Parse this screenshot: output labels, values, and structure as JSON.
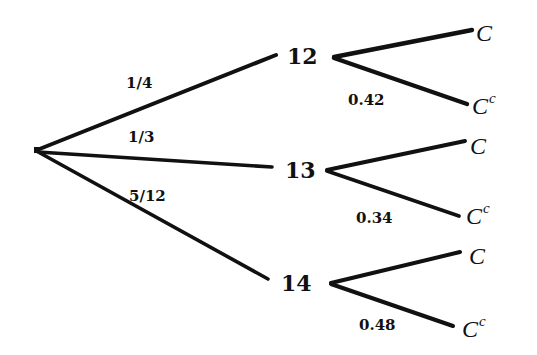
{
  "diagram": {
    "type": "probability-tree",
    "root": {
      "x": 37,
      "y": 150
    },
    "first_level": [
      {
        "id": "12",
        "label": "12",
        "branch_probability": "1/4",
        "outcomes": [
          {
            "label": "C",
            "superscript": "",
            "branch_probability": ""
          },
          {
            "label": "C",
            "superscript": "c",
            "branch_probability": "0.42"
          }
        ]
      },
      {
        "id": "13",
        "label": "13",
        "branch_probability": "1/3",
        "outcomes": [
          {
            "label": "C",
            "superscript": "",
            "branch_probability": ""
          },
          {
            "label": "C",
            "superscript": "c",
            "branch_probability": "0.34"
          }
        ]
      },
      {
        "id": "14",
        "label": "14",
        "branch_probability": "5/12",
        "outcomes": [
          {
            "label": "C",
            "superscript": "",
            "branch_probability": ""
          },
          {
            "label": "C",
            "superscript": "c",
            "branch_probability": "0.48"
          }
        ]
      }
    ],
    "colors": {
      "line": "#111111",
      "text": "#111111",
      "background": "#ffffff"
    }
  }
}
